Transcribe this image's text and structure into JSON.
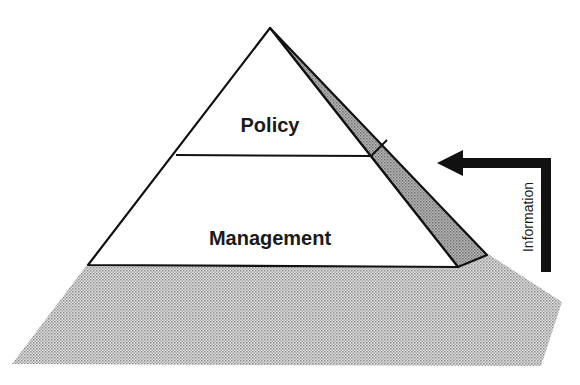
{
  "diagram": {
    "type": "pyramid",
    "layers": [
      {
        "label": "Policy",
        "position": "top"
      },
      {
        "label": "Management",
        "position": "bottom"
      }
    ],
    "arrow": {
      "label": "Information",
      "direction": "up-then-left",
      "color": "#111111"
    },
    "colors": {
      "outline": "#111111",
      "face_fill": "#ffffff",
      "side_fill": "#9a9a9a",
      "shadow_fill": "#c4c4c4"
    }
  }
}
